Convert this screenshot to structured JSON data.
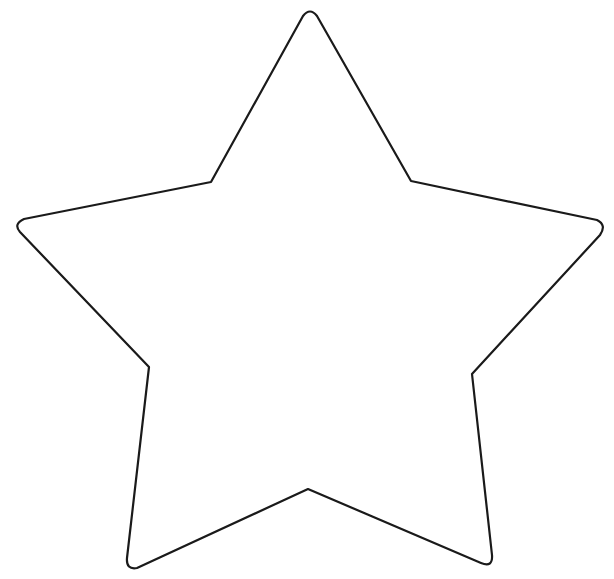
{
  "image": {
    "background": "#ffffff",
    "shape": "star-outline",
    "points": 5,
    "stroke_color": "#1a1a1a",
    "stroke_width": 2.2,
    "fill": "none",
    "path": "M 303,16 Q 310,7 317,16 L 411,181 L 597,220 Q 607,225 600,235 L 472,374 L 492,555 Q 493,568 481,563 L 308,489 L 137,568 Q 126,570 127,558 L 149,367 L 20,232 Q 13,224 24,219 L 211,182 Z"
  }
}
